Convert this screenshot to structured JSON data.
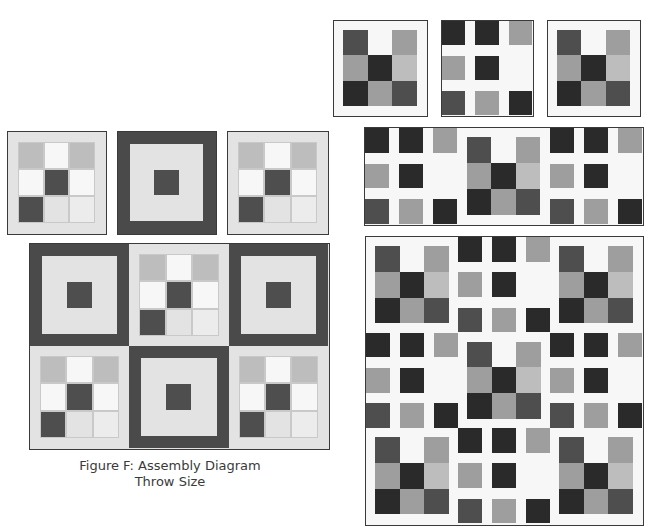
{
  "caption": {
    "line1": "Figure F:  Assembly Diagram",
    "line2": "Throw Size"
  },
  "colors": {
    "background": "#ffffff",
    "light_fabric": "#ececec",
    "white_fabric": "#f7f7f7",
    "mottled_light": "#e3e3e3",
    "light_gray": "#bdbdbd",
    "medium_gray": "#9e9e9e",
    "dark_gray": "#4e4e4e",
    "darkest": "#2a2a2a",
    "frame_dark": "#4a4a4a",
    "outline": "#3a3a3a"
  },
  "left_group": {
    "single_blocks": [
      {
        "type": "nine-patch"
      },
      {
        "type": "framed-center"
      },
      {
        "type": "nine-patch"
      }
    ],
    "assembly": {
      "rows": 2,
      "cols": 3,
      "layout": [
        [
          "framed-center",
          "nine-patch",
          "framed-center"
        ],
        [
          "nine-patch",
          "framed-center",
          "nine-patch"
        ]
      ]
    }
  },
  "right_group": {
    "single_blocks": [
      {
        "type": "nine-patch-dark"
      },
      {
        "type": "lattice"
      },
      {
        "type": "nine-patch-dark"
      }
    ],
    "row_strip": [
      "lattice",
      "nine-patch-dark",
      "lattice"
    ],
    "quilt": {
      "rows": 3,
      "cols": 3,
      "layout": [
        [
          "nine-patch-dark",
          "lattice",
          "nine-patch-dark"
        ],
        [
          "lattice",
          "nine-patch-dark",
          "lattice"
        ],
        [
          "nine-patch-dark",
          "lattice",
          "nine-patch-dark"
        ]
      ]
    }
  }
}
